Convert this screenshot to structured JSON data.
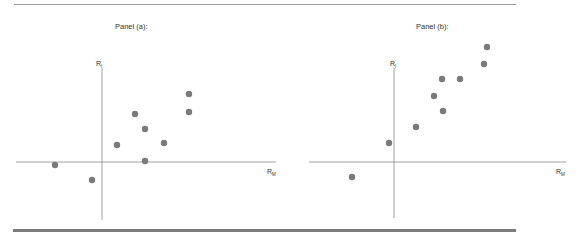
{
  "figure": {
    "panels": [
      {
        "id": "a",
        "title": "Panel (a):",
        "y_label": "R",
        "y_label_sub": "I",
        "x_label": "R",
        "x_label_sub": "M"
      },
      {
        "id": "b",
        "title": "Panel (b):",
        "y_label": "R",
        "y_label_sub": "I",
        "x_label": "R",
        "x_label_sub": "M"
      }
    ],
    "colors": {
      "point": "#7a7a7a",
      "axis": "#8a8a8a",
      "rule": "#7d7d7d"
    }
  },
  "chart_data": [
    {
      "type": "scatter",
      "title": "Panel (a):",
      "xlabel": "R_M",
      "ylabel": "R_I",
      "grid": false,
      "legend": null,
      "ticks": "none (unlabeled axes; origin at axis crossing)",
      "xlim": [
        -8.6,
        17.4
      ],
      "ylim": [
        -5.8,
        9.4
      ],
      "points": [
        {
          "x": -4.7,
          "y": -0.3
        },
        {
          "x": -1.0,
          "y": -1.8
        },
        {
          "x": 1.5,
          "y": 1.7
        },
        {
          "x": 3.3,
          "y": 4.8
        },
        {
          "x": 4.3,
          "y": 3.3
        },
        {
          "x": 4.3,
          "y": 0.1
        },
        {
          "x": 6.2,
          "y": 1.9
        },
        {
          "x": 8.7,
          "y": 6.8
        },
        {
          "x": 8.7,
          "y": 5.0
        }
      ]
    },
    {
      "type": "scatter",
      "title": "Panel (b):",
      "xlabel": "R_M",
      "ylabel": "R_I",
      "grid": false,
      "legend": null,
      "ticks": "none (unlabeled axes; origin at axis crossing)",
      "xlim": [
        -8.5,
        17.2
      ],
      "ylim": [
        -5.6,
        9.4
      ],
      "points": [
        {
          "x": -4.2,
          "y": -1.5
        },
        {
          "x": -0.5,
          "y": 1.9
        },
        {
          "x": 2.2,
          "y": 3.5
        },
        {
          "x": 4.0,
          "y": 6.6
        },
        {
          "x": 4.8,
          "y": 8.3
        },
        {
          "x": 4.9,
          "y": 5.1
        },
        {
          "x": 6.6,
          "y": 8.3
        },
        {
          "x": 9.0,
          "y": 9.8
        },
        {
          "x": 9.3,
          "y": 11.5
        }
      ]
    }
  ]
}
